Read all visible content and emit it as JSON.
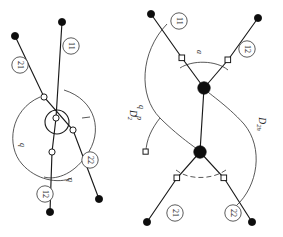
{
  "figure": {
    "orientation": "rotated-90",
    "background_color": "#ffffff",
    "line_color": "#1a1a1a",
    "arc_color": "#3a3a3a"
  },
  "diagrams": [
    {
      "id": "left",
      "symmetry_label": "D",
      "symmetry_subscript": "2",
      "symmetry_full": "D2",
      "atom_labels": [
        {
          "id": "l-11",
          "text": "11",
          "x": 71,
          "y": 46
        },
        {
          "id": "l-21",
          "text": "21",
          "x": 20,
          "y": 65
        },
        {
          "id": "l-22",
          "text": "22",
          "x": 90,
          "y": 160
        },
        {
          "id": "l-12",
          "text": "12",
          "x": 45,
          "y": 194
        }
      ],
      "bond_labels": [
        {
          "id": "l-q-upper",
          "text": "q",
          "x": 22,
          "y": 145
        },
        {
          "id": "l-q-lower",
          "text": "q",
          "x": 70,
          "y": 180
        }
      ],
      "terminal_atoms": [
        {
          "x": 15,
          "y": 36
        },
        {
          "x": 62,
          "y": 22
        },
        {
          "x": 50,
          "y": 212
        },
        {
          "x": 99,
          "y": 199
        }
      ],
      "open_vertices": [
        {
          "x": 44,
          "y": 97
        },
        {
          "x": 56,
          "y": 118
        },
        {
          "x": 73,
          "y": 130
        },
        {
          "x": 52,
          "y": 152
        }
      ],
      "ring_center": {
        "x": 57,
        "y": 122
      },
      "ring_radius": 12
    },
    {
      "id": "right",
      "symmetry_label": "D",
      "symmetry_subscript": "2h",
      "symmetry_full": "D2h",
      "atom_labels": [
        {
          "id": "r-11",
          "text": "11",
          "x": 179,
          "y": 21
        },
        {
          "id": "r-12",
          "text": "12",
          "x": 247,
          "y": 49
        },
        {
          "id": "r-21",
          "text": "21",
          "x": 175,
          "y": 213
        },
        {
          "id": "r-22",
          "text": "22",
          "x": 233,
          "y": 213
        }
      ],
      "bond_labels": [
        {
          "id": "r-a",
          "text": "a",
          "x": 196,
          "y": 52
        },
        {
          "id": "r-p",
          "text": "p",
          "x": 139,
          "y": 118
        },
        {
          "id": "r-q-top",
          "text": "q",
          "x": 141,
          "y": 107
        },
        {
          "id": "r-q-bot",
          "text": "q",
          "x": 176,
          "y": 196
        }
      ],
      "terminal_atoms": [
        {
          "x": 151,
          "y": 14
        },
        {
          "x": 258,
          "y": 18
        },
        {
          "x": 147,
          "y": 222
        },
        {
          "x": 252,
          "y": 222
        }
      ],
      "node_atoms": [
        {
          "x": 204,
          "y": 88,
          "type": "filled-large"
        },
        {
          "x": 200,
          "y": 152,
          "type": "filled-large"
        }
      ],
      "square_vertices": [
        {
          "x": 182,
          "y": 58
        },
        {
          "x": 228,
          "y": 60
        },
        {
          "x": 177,
          "y": 178
        },
        {
          "x": 224,
          "y": 178
        }
      ]
    }
  ]
}
